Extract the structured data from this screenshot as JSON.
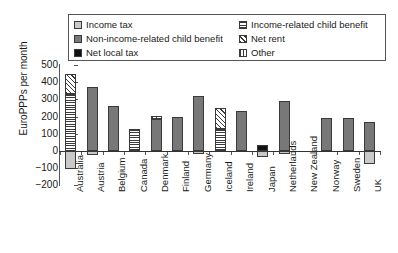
{
  "chart_data": {
    "type": "bar",
    "title": "",
    "xlabel": "",
    "ylabel": "EuroPPPs per month",
    "ylim": [
      -200,
      500
    ],
    "yticks": [
      500,
      400,
      300,
      200,
      100,
      0,
      -100,
      -200
    ],
    "ytick_labels": [
      "500",
      "400",
      "300",
      "200",
      "100",
      "0",
      "−100",
      "−200"
    ],
    "grid": false,
    "stacked": true,
    "legend_position": "top",
    "categories": [
      "Australia",
      "Austria",
      "Belgium",
      "Canada",
      "Denmark",
      "Finland",
      "Germany",
      "Iceland",
      "Ireland",
      "Japan",
      "Netherlands",
      "New Zealand",
      "Norway",
      "Sweden",
      "UK"
    ],
    "series": [
      {
        "name": "Income tax",
        "key": "income_tax",
        "pattern": "light-gray",
        "color": "#c9c9c9",
        "values": [
          -105,
          -25,
          0,
          0,
          0,
          0,
          -20,
          0,
          0,
          -35,
          -20,
          0,
          0,
          0,
          -75
        ]
      },
      {
        "name": "Non-income-related child benefit",
        "key": "non_income_related_child_benefit",
        "pattern": "dark-gray",
        "color": "#787878",
        "values": [
          0,
          370,
          260,
          0,
          185,
          195,
          320,
          0,
          230,
          0,
          290,
          0,
          190,
          190,
          170
        ]
      },
      {
        "name": "Net local tax",
        "key": "net_local_tax",
        "pattern": "black",
        "color": "#111111",
        "values": [
          0,
          0,
          0,
          0,
          0,
          0,
          0,
          0,
          0,
          35,
          0,
          0,
          0,
          0,
          0
        ]
      },
      {
        "name": "Income-related child benefit",
        "key": "income_related_child_benefit",
        "pattern": "horizontal-lines",
        "color": "#ffffff",
        "values": [
          330,
          0,
          0,
          130,
          0,
          0,
          0,
          130,
          0,
          0,
          0,
          0,
          0,
          0,
          0
        ]
      },
      {
        "name": "Net rent",
        "key": "net_rent",
        "pattern": "diagonal-hatch",
        "color": "#ffffff",
        "values": [
          120,
          0,
          0,
          0,
          20,
          0,
          0,
          120,
          0,
          0,
          0,
          0,
          0,
          0,
          0
        ]
      },
      {
        "name": "Other",
        "key": "other",
        "pattern": "vertical-lines",
        "color": "#ffffff",
        "values": [
          0,
          0,
          0,
          0,
          0,
          0,
          0,
          0,
          0,
          0,
          0,
          0,
          0,
          0,
          0
        ]
      }
    ],
    "totals_positive": [
      450,
      370,
      260,
      130,
      205,
      195,
      320,
      250,
      230,
      70,
      290,
      0,
      190,
      190,
      245
    ],
    "totals_negative": [
      -105,
      -25,
      0,
      0,
      0,
      0,
      -20,
      0,
      0,
      -35,
      -20,
      0,
      0,
      0,
      -75
    ]
  },
  "legend": {
    "entries": [
      {
        "label": "Income tax",
        "swatch": "light-gray"
      },
      {
        "label": "Income-related child benefit",
        "swatch": "horizontal-lines"
      },
      {
        "label": "Non-income-related child benefit",
        "swatch": "dark-gray"
      },
      {
        "label": "Net rent",
        "swatch": "diagonal-hatch"
      },
      {
        "label": "Net local tax",
        "swatch": "black"
      },
      {
        "label": "Other",
        "swatch": "vertical-lines"
      }
    ]
  }
}
